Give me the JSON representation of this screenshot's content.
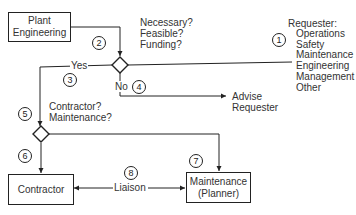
{
  "diagram": {
    "boxes": {
      "plant_engineering": {
        "line1": "Plant",
        "line2": "Engineering"
      },
      "contractor": {
        "label": "Contractor"
      },
      "maintenance": {
        "line1": "Maintenance",
        "line2": "(Planner)"
      }
    },
    "decision1": {
      "questions": [
        "Necessary?",
        "Feasible?",
        "Funding?"
      ],
      "yes_label": "Yes",
      "no_label": "No"
    },
    "decision2": {
      "questions": [
        "Contractor?",
        "Maintenance?"
      ]
    },
    "advise": {
      "line1": "Advise",
      "line2": "Requester"
    },
    "liaison_label": "Liaison",
    "requester": {
      "title": "Requester:",
      "items": [
        "Operations",
        "Safety",
        "Maintenance",
        "Engineering",
        "Management",
        "Other"
      ]
    },
    "steps": [
      "1",
      "2",
      "3",
      "4",
      "5",
      "6",
      "7",
      "8"
    ],
    "colors": {
      "line": "#222222",
      "text": "#333333",
      "background": "#ffffff"
    }
  }
}
